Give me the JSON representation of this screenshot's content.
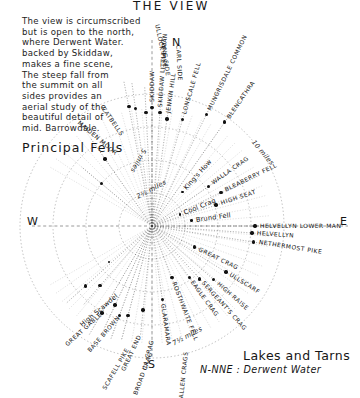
{
  "page": {
    "title": "THE VIEW",
    "subheading": "Principal Fells",
    "note": "The view is circumscribed\nbut is open to the north,\nwhere Derwent Water.\nbacked by Skiddaw,\nmakes a fine scene,\nThe steep fall from\nthe summit on all\nsides provides an\naerial study of the\nbeautiful detail of\nmid. Barrowdale.",
    "footer_heading": "Lakes and Tarns",
    "footer_entry": "N-NNE : Derwent Water",
    "ink_color": "#141414",
    "paper_color": "#ffffff"
  },
  "compass": {
    "north": "N",
    "east": "E",
    "south": "S",
    "west": "W"
  },
  "chart_data": {
    "type": "scatter",
    "title": "THE VIEW",
    "subtitle": "Principal Fells",
    "xlabel": "",
    "ylabel": "",
    "grid": true,
    "legend_position": "none",
    "radial_axis_label": "distance in miles",
    "distance_rings": [
      {
        "label": "2½ miles",
        "value": 2.5
      },
      {
        "label": "5 miles",
        "value": 5
      },
      {
        "label": "7½ miles",
        "value": 7.5
      },
      {
        "label": "10 miles",
        "value": 10
      }
    ],
    "compass_points": [
      "N",
      "E",
      "S",
      "W"
    ],
    "categories": [
      "ULLOCK PIKE",
      "LONG SIDE",
      "CARL SIDE",
      "SKIDDAW",
      "SKIDDAW LITTLE MAN",
      "JENKIN HILL",
      "LONSCALE FELL",
      "MUNGRISDALE COMMON",
      "BLENCATHRA",
      "WALLA CRAG",
      "BLEABERRY FELL",
      "HIGH SEAT",
      "HELVELLYN LOWER MAN",
      "HELVELLYN",
      "NETHERMOST PIKE",
      "GREAT CRAG",
      "ULLSCARF",
      "HIGH RAISE",
      "SERGEANT'S CRAG",
      "EAGLE CRAG",
      "ROSTHWAITE FELL",
      "GLARAMARA",
      "ALLEN CRAGS",
      "ILL CRAG",
      "BROAD CRAG",
      "GREAT END",
      "SCAFELL PIKE",
      "BASE BROWN",
      "GREAT GABLE",
      "CATBELLS",
      "MAIDEN MOOR"
    ],
    "points": [
      {
        "name": "ULLOCK PIKE",
        "bearing_deg": 349,
        "distance_mi": 9.2,
        "angle_css": -101
      },
      {
        "name": "LONG SIDE",
        "bearing_deg": 352,
        "distance_mi": 9.0,
        "angle_css": -98
      },
      {
        "name": "CARL SIDE",
        "bearing_deg": 357,
        "distance_mi": 8.6,
        "angle_css": -93
      },
      {
        "name": "SKIDDAW",
        "bearing_deg": 360,
        "distance_mi": 9.0,
        "angle_css": -90
      },
      {
        "name": "SKIDDAW LITTLE MAN",
        "bearing_deg": 4,
        "distance_mi": 8.6,
        "angle_css": -86
      },
      {
        "name": "JENKIN HILL",
        "bearing_deg": 8,
        "distance_mi": 8.2,
        "angle_css": -82
      },
      {
        "name": "LONSCALE FELL",
        "bearing_deg": 16,
        "distance_mi": 8.4,
        "angle_css": -74
      },
      {
        "name": "MUNGRISDALE COMMON",
        "bearing_deg": 26,
        "distance_mi": 9.4,
        "angle_css": -64
      },
      {
        "name": "BLENCATHRA",
        "bearing_deg": 35,
        "distance_mi": 9.6,
        "angle_css": -55
      },
      {
        "name": "WALLA CRAG",
        "bearing_deg": 55,
        "distance_mi": 5.2,
        "angle_css": -35
      },
      {
        "name": "BLEABERRY FELL",
        "bearing_deg": 64,
        "distance_mi": 5.8,
        "angle_css": -26
      },
      {
        "name": "HIGH SEAT",
        "bearing_deg": 72,
        "distance_mi": 5.1,
        "angle_css": -18
      },
      {
        "name": "HELVELLYN LOWER MAN",
        "bearing_deg": 90,
        "distance_mi": 7.8,
        "angle_css": 0
      },
      {
        "name": "HELVELLYN",
        "bearing_deg": 94,
        "distance_mi": 7.6,
        "angle_css": 4
      },
      {
        "name": "NETHERMOST PIKE",
        "bearing_deg": 99,
        "distance_mi": 7.8,
        "angle_css": 9
      },
      {
        "name": "GREAT CRAG",
        "bearing_deg": 116,
        "distance_mi": 3.6,
        "angle_css": 26
      },
      {
        "name": "ULLSCARF",
        "bearing_deg": 122,
        "distance_mi": 6.6,
        "angle_css": 32
      },
      {
        "name": "HIGH RAISE",
        "bearing_deg": 131,
        "distance_mi": 6.2,
        "angle_css": 41
      },
      {
        "name": "SERGEANT'S CRAG",
        "bearing_deg": 138,
        "distance_mi": 5.4,
        "angle_css": 48
      },
      {
        "name": "EAGLE CRAG",
        "bearing_deg": 144,
        "distance_mi": 4.8,
        "angle_css": 54
      },
      {
        "name": "ROSTHWAITE FELL",
        "bearing_deg": 159,
        "distance_mi": 4.2,
        "angle_css": 69
      },
      {
        "name": "GLARAMARA",
        "bearing_deg": 172,
        "distance_mi": 5.6,
        "angle_css": 82
      },
      {
        "name": "ALLEN CRAGS",
        "bearing_deg": 186,
        "distance_mi": 6.4,
        "angle_css": 96
      },
      {
        "name": "ILL CRAG",
        "bearing_deg": 195,
        "distance_mi": 7.0,
        "angle_css": 105
      },
      {
        "name": "BROAD CRAG",
        "bearing_deg": 200,
        "distance_mi": 7.2,
        "angle_css": 110
      },
      {
        "name": "GREAT END",
        "bearing_deg": 205,
        "distance_mi": 6.6,
        "angle_css": 115
      },
      {
        "name": "SCAFELL PIKE",
        "bearing_deg": 210,
        "distance_mi": 7.6,
        "angle_css": 120
      },
      {
        "name": "BASE BROWN",
        "bearing_deg": 221,
        "distance_mi": 6.0,
        "angle_css": 131
      },
      {
        "name": "GREAT GABLE",
        "bearing_deg": 228,
        "distance_mi": 6.8,
        "angle_css": 138
      },
      {
        "name": "MAIDEN MOOR",
        "bearing_deg": 310,
        "distance_mi": 5.0,
        "angle_css": -140
      },
      {
        "name": "CATBELLS",
        "bearing_deg": 325,
        "distance_mi": 6.2,
        "angle_css": -125
      }
    ],
    "minor_places": [
      {
        "name": "Cool Crag",
        "angle_css": -22
      },
      {
        "name": "King's How",
        "angle_css": -48
      },
      {
        "name": "Brund Fell",
        "angle_css": -8
      },
      {
        "name": "High Scawdel",
        "angle_css": 140
      }
    ]
  }
}
